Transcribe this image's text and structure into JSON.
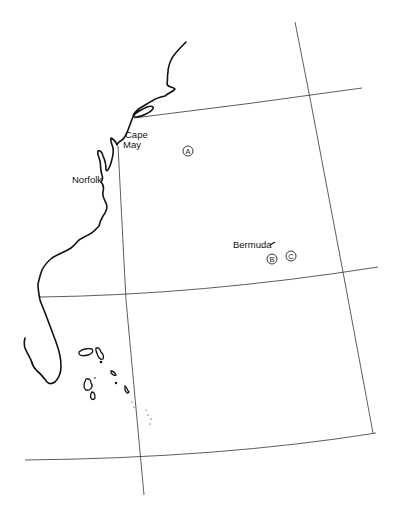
{
  "map": {
    "type": "regional outline map",
    "region": "Western North Atlantic / US East Coast",
    "colors": {
      "background": "#ffffff",
      "ink": "#111111",
      "graticule": "#333333"
    },
    "place_labels": [
      {
        "id": "cape-may",
        "lines": [
          "Cape",
          "May"
        ]
      },
      {
        "id": "norfolk",
        "text": "Norfolk"
      },
      {
        "id": "bermuda",
        "text": "Bermuda"
      }
    ],
    "site_markers": [
      {
        "id": "A",
        "letter": "A"
      },
      {
        "id": "B",
        "letter": "B"
      },
      {
        "id": "C",
        "letter": "C"
      }
    ]
  }
}
